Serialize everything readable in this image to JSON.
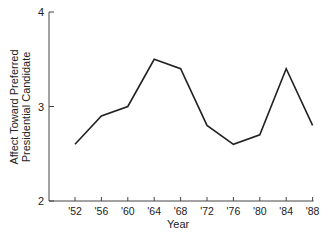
{
  "chart_data": {
    "type": "line",
    "title": "",
    "xlabel": "Year",
    "ylabel": "Affect Toward Preferred Presidential Candidate",
    "ylabel_lines": [
      "Affect Toward Preferred",
      "Presidential Candidate"
    ],
    "categories": [
      "'52",
      "'56",
      "'60",
      "'64",
      "'68",
      "'72",
      "'76",
      "'80",
      "'84",
      "'88"
    ],
    "values": [
      2.6,
      2.9,
      3.0,
      3.5,
      3.4,
      2.8,
      2.6,
      2.7,
      3.4,
      2.8
    ],
    "ylim": [
      2,
      4
    ],
    "yticks": [
      "2",
      "3",
      "4"
    ],
    "grid": false,
    "legend": null,
    "line_color": "#222222"
  }
}
